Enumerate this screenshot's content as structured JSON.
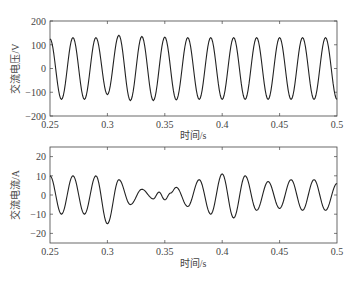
{
  "chart_data": [
    {
      "type": "line",
      "title": "",
      "xlabel": "时间/s",
      "ylabel": "交流电压/V",
      "xlim": [
        0.25,
        0.5
      ],
      "ylim": [
        -200,
        200
      ],
      "xticks": [
        "0.25",
        "0.3",
        "0.35",
        "0.4",
        "0.45",
        "0.5"
      ],
      "yticks": [
        "200",
        "100",
        "0",
        "-100",
        "-200"
      ],
      "grid": false,
      "series": [
        {
          "name": "ac-voltage",
          "description": "approx. 50 Hz sinusoid, amplitude ~130 V, small disturbance near 0.30 s (trough ~-110 V), peak ~140 V at 0.31 s",
          "frequency_hz": 50,
          "amplitude": 130,
          "x": [
            0.25,
            0.26,
            0.27,
            0.28,
            0.29,
            0.3,
            0.31,
            0.32,
            0.33,
            0.34,
            0.35,
            0.36,
            0.37,
            0.38,
            0.39,
            0.4,
            0.41,
            0.42,
            0.43,
            0.44,
            0.45,
            0.46,
            0.47,
            0.48,
            0.49,
            0.5
          ],
          "y": [
            125,
            -130,
            130,
            -130,
            130,
            -110,
            140,
            -135,
            135,
            -135,
            132,
            -132,
            130,
            -130,
            130,
            -130,
            130,
            -130,
            130,
            -130,
            130,
            -130,
            130,
            -130,
            130,
            -130
          ]
        }
      ]
    },
    {
      "type": "line",
      "title": "",
      "xlabel": "时间/s",
      "ylabel": "交流电流/A",
      "xlim": [
        0.25,
        0.5
      ],
      "ylim": [
        -25,
        25
      ],
      "xticks": [
        "0.25",
        "0.3",
        "0.35",
        "0.4",
        "0.45",
        "0.5"
      ],
      "yticks": [
        "20",
        "10",
        "0",
        "-10",
        "-20"
      ],
      "grid": false,
      "series": [
        {
          "name": "ac-current",
          "description": "approx. 50 Hz oscillation, ~10 A before fault, dip to ~-15 A at 0.301 s, damped to ~3 A around 0.33-0.36 s, recovering to ~8-11 A after 0.38 s",
          "x": [
            0.25,
            0.26,
            0.27,
            0.28,
            0.29,
            0.3,
            0.31,
            0.32,
            0.33,
            0.34,
            0.345,
            0.35,
            0.355,
            0.36,
            0.37,
            0.38,
            0.39,
            0.4,
            0.41,
            0.42,
            0.43,
            0.44,
            0.45,
            0.46,
            0.47,
            0.48,
            0.49,
            0.5
          ],
          "y": [
            10,
            -10,
            10,
            -10,
            10,
            -15,
            8,
            -5,
            3,
            -2,
            1.5,
            -2.5,
            1,
            4,
            -6,
            8,
            -10,
            11,
            -12,
            10,
            -8,
            7,
            -7,
            8,
            -8,
            8,
            -8,
            6
          ]
        }
      ]
    }
  ],
  "plots": {
    "top": {
      "ylabel": "交流电压/V",
      "xlabel": "时间/s",
      "yticks": [
        "200",
        "100",
        "0",
        "−100",
        "−200"
      ],
      "xticks": [
        "0.25",
        "0.3",
        "0.35",
        "0.4",
        "0.45",
        "0.5"
      ]
    },
    "bottom": {
      "ylabel": "交流电流/A",
      "xlabel": "时间/s",
      "yticks": [
        "20",
        "10",
        "0",
        "−10",
        "−20"
      ],
      "xticks": [
        "0.25",
        "0.3",
        "0.35",
        "0.4",
        "0.45",
        "0.5"
      ]
    }
  },
  "colors": {
    "trace": "#222222",
    "axis": "#444444",
    "background": "#ffffff"
  }
}
